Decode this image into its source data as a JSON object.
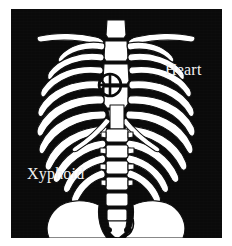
{
  "figure": {
    "background_color": "#ffffff",
    "panel_color": "#0a0a0a",
    "bone_color": "#ffffff",
    "label_color": "#f2f2f2"
  },
  "labels": {
    "heart": "Heart",
    "xyphoid": "Xyphoid"
  },
  "marker": {
    "name": "crosshair-target",
    "meaning": "heart location on sternum",
    "center_x": 99,
    "center_y": 76,
    "radius": 11
  },
  "anatomy": {
    "parts": [
      "clavicle-left",
      "clavicle-right",
      "manubrium",
      "sternum-body",
      "xiphoid-process",
      "ribs-left",
      "ribs-right",
      "costal-margin",
      "thoracic-spine",
      "lumbar-spine",
      "sacrum",
      "pelvis-left",
      "pelvis-right"
    ]
  }
}
